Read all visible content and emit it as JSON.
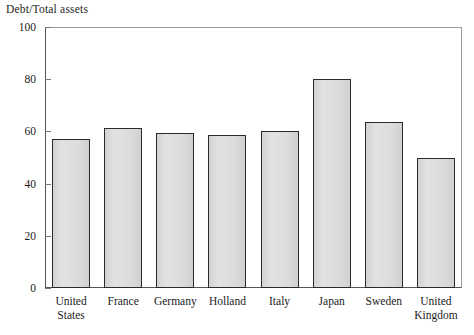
{
  "chart_data": {
    "type": "bar",
    "title": "Debt/Total assets",
    "xlabel": "",
    "ylabel": "Debt/Total assets",
    "ylim": [
      0,
      100
    ],
    "yticks": [
      0,
      20,
      40,
      60,
      80,
      100
    ],
    "grid": false,
    "legend": "none",
    "categories": [
      "United States",
      "France",
      "Germany",
      "Holland",
      "Italy",
      "Japan",
      "Sweden",
      "United Kingdom"
    ],
    "values": [
      57,
      61.5,
      59.5,
      58.5,
      60,
      80,
      63.5,
      50
    ],
    "bar_fill_color": "#dcdcdc",
    "bar_edge_color": "#2b2b2b"
  },
  "axis": {
    "y_tick_labels": [
      "100",
      "80",
      "60",
      "40",
      "20",
      "0"
    ],
    "x_tick_labels": [
      [
        "United",
        "States"
      ],
      [
        "France"
      ],
      [
        "Germany"
      ],
      [
        "Holland"
      ],
      [
        "Italy"
      ],
      [
        "Japan"
      ],
      [
        "Sweden"
      ],
      [
        "United",
        "Kingdom"
      ]
    ]
  }
}
